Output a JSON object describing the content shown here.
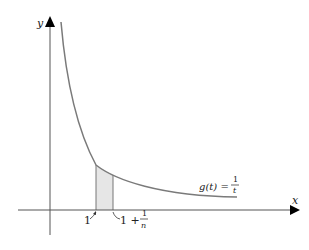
{
  "axes": {
    "x_label": "x",
    "y_label": "y"
  },
  "curve": {
    "label_lhs": "g(t) =",
    "label_num": "1",
    "label_den": "t",
    "color": "#7a7a7a"
  },
  "region": {
    "fill": "#e6e6e6",
    "left_label": "1",
    "right_label_prefix": "1 +",
    "right_label_num": "1",
    "right_label_den": "n"
  }
}
